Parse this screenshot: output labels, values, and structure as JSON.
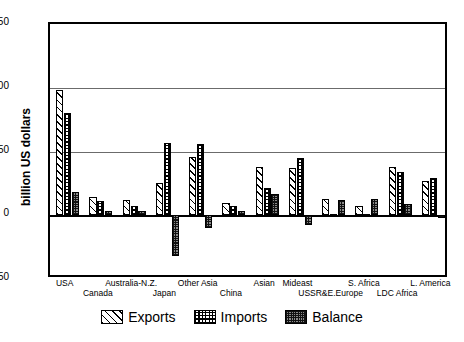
{
  "chart_data": {
    "type": "bar",
    "title": "",
    "xlabel": "",
    "ylabel": "billion US dollars",
    "ylim": [
      -50,
      150
    ],
    "yticks": [
      -50,
      0,
      50,
      100,
      150
    ],
    "grid": true,
    "legend_position": "bottom",
    "categories": [
      "USA",
      "Canada",
      "Australia-N.Z.",
      "Japan",
      "Other Asia",
      "China",
      "Asian",
      "Mideast",
      "USSR&E.Europe",
      "S. Africa",
      "LDC Africa",
      "L. America"
    ],
    "series": [
      {
        "name": "Exports",
        "values": [
          98,
          14,
          12,
          25,
          46,
          10,
          38,
          37,
          13,
          7,
          38,
          27
        ]
      },
      {
        "name": "Imports",
        "values": [
          80,
          11,
          7,
          57,
          56,
          7,
          21,
          45,
          1,
          1,
          34,
          29
        ]
      },
      {
        "name": "Balance",
        "values": [
          18,
          3,
          3,
          -32,
          -10,
          3,
          17,
          -8,
          12,
          13,
          9,
          -2
        ]
      }
    ]
  },
  "axis": {
    "y_title": "billion US dollars",
    "y_ticks": [
      "150",
      "100",
      "50",
      "0",
      "-50"
    ]
  },
  "categories_layout": [
    {
      "label": "USA",
      "row": 0
    },
    {
      "label": "Canada",
      "row": 1
    },
    {
      "label": "Australia-N.Z.",
      "row": 0
    },
    {
      "label": "Japan",
      "row": 1
    },
    {
      "label": "Other Asia",
      "row": 0
    },
    {
      "label": "China",
      "row": 1
    },
    {
      "label": "Asian",
      "row": 0
    },
    {
      "label": "Mideast",
      "row": 0
    },
    {
      "label": "USSR&E.Europe",
      "row": 1
    },
    {
      "label": "S. Africa",
      "row": 0
    },
    {
      "label": "LDC Africa",
      "row": 1
    },
    {
      "label": "L. America",
      "row": 0
    }
  ],
  "legend": {
    "items": [
      {
        "label": "Exports",
        "pattern": "diagonal-hatch"
      },
      {
        "label": "Imports",
        "pattern": "checkerboard"
      },
      {
        "label": "Balance",
        "pattern": "dark-stipple"
      }
    ]
  },
  "colors": {
    "frame": "#000000",
    "gridline": "#6b6b6b",
    "balance_fill": "#8a8a8a",
    "background": "#ffffff"
  }
}
